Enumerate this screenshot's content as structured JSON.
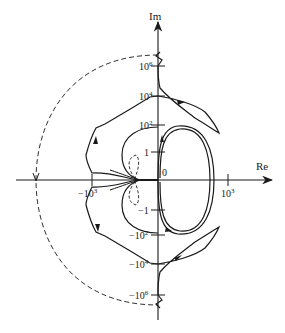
{
  "diagram": {
    "type": "nyquist-plot",
    "axes": {
      "imag_label": "Im",
      "real_label": "Re"
    },
    "imag_ticks": [
      {
        "base": "10",
        "exp": "6",
        "sign": ""
      },
      {
        "base": "10",
        "exp": "4",
        "sign": ""
      },
      {
        "base": "10",
        "exp": "2",
        "sign": ""
      },
      {
        "base": "1",
        "exp": "",
        "sign": ""
      },
      {
        "base": "0",
        "exp": "",
        "sign": ""
      },
      {
        "base": "1",
        "exp": "",
        "sign": "−"
      },
      {
        "base": "10",
        "exp": "2",
        "sign": "−"
      },
      {
        "base": "10",
        "exp": "4",
        "sign": "−"
      },
      {
        "base": "10",
        "exp": "6",
        "sign": "−"
      }
    ],
    "real_ticks": [
      {
        "base": "10",
        "exp": "3",
        "sign": "−"
      },
      {
        "base": "10",
        "exp": "3",
        "sign": ""
      }
    ],
    "labels": {
      "im": "Im",
      "re": "Re",
      "zero": "0",
      "one": "1",
      "neg_one": "−1",
      "p1e2_base": "10",
      "p1e2_exp": "2",
      "p1e4_base": "10",
      "p1e4_exp": "4",
      "p1e6_base": "10",
      "p1e6_exp": "6",
      "n1e2_base": "−10",
      "n1e2_exp": "2",
      "n1e4_base": "−10",
      "n1e4_exp": "4",
      "n1e6_base": "−10",
      "n1e6_exp": "6",
      "re_p1e3_base": "10",
      "re_p1e3_exp": "3",
      "re_n1e3_base": "−10",
      "re_n1e3_exp": "3"
    },
    "curves": [
      "solid Nyquist contour (positive and negative frequency branches, mirror symmetric about Re axis)",
      "dashed semicircle at infinity (left half-plane closure)",
      "dashed small loop near origin"
    ],
    "colors": {
      "ink": "#1a1a1a",
      "background": "#ffffff"
    }
  }
}
